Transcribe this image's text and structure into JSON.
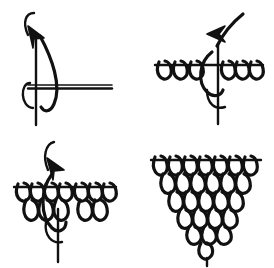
{
  "figure": {
    "background_color": "#ffffff",
    "ink_color": "#111111",
    "panel_count": 4,
    "panel_layout": "2x2 grid"
  },
  "panels": [
    {
      "id": "panel-1",
      "step_number": "1",
      "name": "start-loop-on-foundation-bar",
      "position": "top-left",
      "elements": {
        "hook": {
          "name": "crochet-hook-arrow",
          "direction": "up",
          "has_arrowhead": true,
          "arrowhead_style": "open-triangle"
        },
        "foundation_bar": {
          "name": "foundation-chain-bar",
          "orientation": "horizontal",
          "style": "double-line"
        },
        "working_yarn": {
          "name": "working-yarn-tail",
          "orientation": "vertical"
        },
        "loop_count": 1,
        "row_count": 1
      }
    },
    {
      "id": "panel-2",
      "step_number": "2",
      "name": "first-row-of-loop-stitches",
      "position": "top-right",
      "elements": {
        "hook": {
          "name": "crochet-hook-arrow",
          "direction": "up",
          "has_arrowhead": true,
          "arrowhead_style": "open-triangle"
        },
        "foundation_bar": {
          "name": "foundation-chain-bar",
          "orientation": "horizontal",
          "style": "single-line"
        },
        "working_yarn": {
          "name": "working-yarn-tail",
          "orientation": "vertical"
        },
        "loops_left_of_hook": 3,
        "loops_right_of_hook": 3,
        "loop_count": 6,
        "row_count": 1
      }
    },
    {
      "id": "panel-3",
      "step_number": "3",
      "name": "second-row-decreasing",
      "position": "bottom-left",
      "elements": {
        "hook": {
          "name": "crochet-hook-arrow",
          "direction": "up",
          "has_arrowhead": true,
          "arrowhead_style": "open-triangle"
        },
        "foundation_bar": {
          "name": "foundation-chain-bar",
          "orientation": "horizontal",
          "style": "single-line"
        },
        "working_yarn": {
          "name": "working-yarn-tail",
          "orientation": "vertical"
        },
        "row_count": 2,
        "loops_per_row": [
          7,
          5
        ]
      }
    },
    {
      "id": "panel-4",
      "step_number": "4",
      "name": "completed-triangle-motif",
      "position": "bottom-right",
      "elements": {
        "hook": {
          "name": "crochet-hook-arrow",
          "present": false
        },
        "foundation_bar": {
          "name": "foundation-chain-bar",
          "orientation": "horizontal",
          "style": "single-line"
        },
        "row_count": 6,
        "loops_per_row": [
          7,
          6,
          5,
          4,
          3,
          1
        ],
        "shape": "inverted-triangle"
      }
    }
  ]
}
